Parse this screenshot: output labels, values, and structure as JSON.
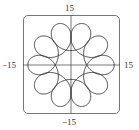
{
  "chart_data": {
    "type": "line",
    "title": "",
    "xlabel": "",
    "ylabel": "",
    "xlim": [
      -15,
      15
    ],
    "ylim": [
      -15,
      15
    ],
    "grid": false,
    "legend": null,
    "tick_labels": {
      "top": "15",
      "bottom": "-15",
      "left": "-15",
      "right": "15"
    },
    "curve": {
      "kind": "parametric",
      "x": "9 cos t + 4.5 cos(-9t)",
      "y": "9 sin t + 4.5 sin(-9t)",
      "t_range": [
        0,
        6.2832
      ],
      "loops": 10,
      "outer_radius": 13.5,
      "inner_radius": 4.5
    },
    "colors": {
      "curve": "#333333",
      "axes": "#555555",
      "frame": "#777777"
    }
  },
  "labels": {
    "top": "15",
    "bottom": "−15",
    "left": "−15",
    "right": "15"
  }
}
